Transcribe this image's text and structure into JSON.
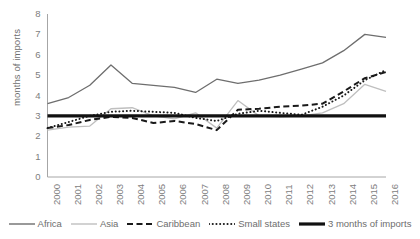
{
  "chart_data": {
    "type": "line",
    "title": "",
    "xlabel": "",
    "ylabel": "months of imports",
    "x": [
      2000,
      2001,
      2002,
      2003,
      2004,
      2005,
      2006,
      2007,
      2008,
      2009,
      2010,
      2011,
      2012,
      2013,
      2014,
      2015,
      2016
    ],
    "categories": [
      "2000",
      "2001",
      "2002",
      "2003",
      "2004",
      "2005",
      "2006",
      "2007",
      "2008",
      "2009",
      "2010",
      "2011",
      "2012",
      "2013",
      "2014",
      "2015",
      "2016"
    ],
    "ylim": [
      0,
      8
    ],
    "xlim": [
      2000,
      2016
    ],
    "yticks": [
      0,
      1,
      2,
      3,
      4,
      5,
      6,
      7,
      8
    ],
    "grid": false,
    "legend_position": "bottom",
    "series": [
      {
        "name": "Africa",
        "style": "solid",
        "color": "#6e6e6e",
        "width": 1.3,
        "values": [
          3.6,
          3.9,
          4.5,
          5.5,
          4.6,
          4.5,
          4.4,
          4.15,
          4.8,
          4.6,
          4.75,
          5.0,
          5.3,
          5.6,
          6.2,
          7.0,
          6.85
        ]
      },
      {
        "name": "Asia",
        "style": "solid",
        "color": "#bfbfbf",
        "width": 1.3,
        "values": [
          2.3,
          2.45,
          2.5,
          3.35,
          3.4,
          3.0,
          2.85,
          3.15,
          2.4,
          3.75,
          3.0,
          2.95,
          3.0,
          3.15,
          3.6,
          4.55,
          4.2
        ]
      },
      {
        "name": "Caribbean",
        "style": "dashed",
        "color": "#1a1a1a",
        "width": 2.0,
        "values": [
          2.4,
          2.55,
          2.8,
          2.95,
          2.9,
          2.65,
          2.75,
          2.6,
          2.3,
          3.3,
          3.35,
          3.45,
          3.5,
          3.6,
          4.2,
          4.85,
          5.15
        ]
      },
      {
        "name": "Small states",
        "style": "dotted",
        "color": "#1a1a1a",
        "width": 2.0,
        "values": [
          2.4,
          2.7,
          3.0,
          3.2,
          3.25,
          3.2,
          3.15,
          2.9,
          2.75,
          3.1,
          3.25,
          3.15,
          3.05,
          3.45,
          4.0,
          4.75,
          5.25
        ]
      },
      {
        "name": "3 months of imports",
        "style": "solid-thick",
        "color": "#111111",
        "width": 3.2,
        "values": [
          3,
          3,
          3,
          3,
          3,
          3,
          3,
          3,
          3,
          3,
          3,
          3,
          3,
          3,
          3,
          3,
          3
        ]
      }
    ]
  },
  "legend": {
    "items": [
      {
        "label": "Africa",
        "style": "solid",
        "color": "#6e6e6e"
      },
      {
        "label": "Asia",
        "style": "solid",
        "color": "#bfbfbf"
      },
      {
        "label": "Caribbean",
        "style": "dashed",
        "color": "#1a1a1a"
      },
      {
        "label": "Small states",
        "style": "dotted",
        "color": "#1a1a1a"
      },
      {
        "label": "3 months of imports",
        "style": "solid-thick",
        "color": "#111111"
      }
    ]
  }
}
